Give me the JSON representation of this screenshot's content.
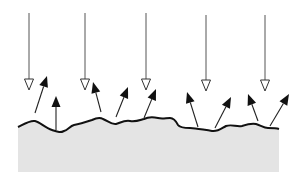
{
  "diagram": {
    "type": "surface-scattering",
    "colors": {
      "background": "#ffffff",
      "surface_fill": "#e4e4e4",
      "surface_line": "#111111",
      "incident_line": "#555555",
      "reflected_head": "#111111"
    },
    "incident_rays": [
      {
        "x": 29,
        "y1": 13,
        "y2": 90
      },
      {
        "x": 85,
        "y1": 13,
        "y2": 90
      },
      {
        "x": 146,
        "y1": 13,
        "y2": 90
      },
      {
        "x": 206,
        "y1": 15,
        "y2": 91
      },
      {
        "x": 265,
        "y1": 15,
        "y2": 91
      }
    ],
    "reflected_rays": [
      {
        "x1": 35,
        "y1": 113,
        "x2": 47,
        "y2": 76
      },
      {
        "x1": 56,
        "y1": 130,
        "x2": 56,
        "y2": 96
      },
      {
        "x1": 101,
        "y1": 112,
        "x2": 93,
        "y2": 82
      },
      {
        "x1": 116,
        "y1": 117,
        "x2": 128,
        "y2": 87
      },
      {
        "x1": 144,
        "y1": 118,
        "x2": 156,
        "y2": 89
      },
      {
        "x1": 198,
        "y1": 127,
        "x2": 187,
        "y2": 92
      },
      {
        "x1": 215,
        "y1": 128,
        "x2": 231,
        "y2": 97
      },
      {
        "x1": 258,
        "y1": 121,
        "x2": 248,
        "y2": 94
      },
      {
        "x1": 270,
        "y1": 126,
        "x2": 289,
        "y2": 94
      }
    ],
    "surface_profile": "M18,127 C24,124 30,120 35,121 C40,122 45,128 52,130 C58,132 60,133 64,131 C68,130 70,126 74,125 C80,124 86,122 92,120 C96,118 100,117 103,119 C108,121 112,125 116,124 C120,123 124,120 130,121 C136,122 140,120 144,119 C148,117 153,117 158,118 C162,119 166,118 170,118 C174,118 176,121 178,125 C180,128 185,128 190,128 C196,128 204,130 212,131 C218,132 222,128 226,126 C232,124 236,127 242,126 C248,124 252,123 256,124 C260,125 264,128 268,128 C272,128 276,128 279,129",
    "surface_bottom": 172,
    "surface_left": 18,
    "surface_right": 279
  }
}
